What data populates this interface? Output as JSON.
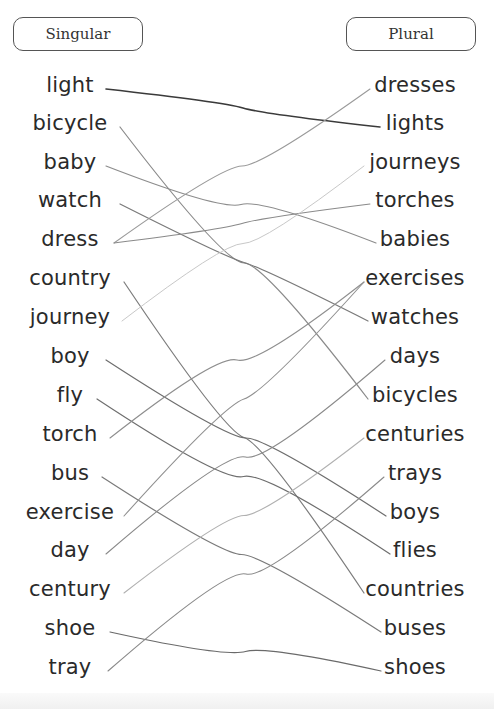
{
  "headers": {
    "singular": "Singular",
    "plural": "Plural"
  },
  "singular_words": [
    {
      "word": "light",
      "y": 87,
      "x_end": 104
    },
    {
      "word": "bicycle",
      "y": 125,
      "x_end": 118
    },
    {
      "word": "baby",
      "y": 164,
      "x_end": 104
    },
    {
      "word": "watch",
      "y": 202,
      "x_end": 118
    },
    {
      "word": "dress",
      "y": 241,
      "x_end": 112
    },
    {
      "word": "country",
      "y": 280,
      "x_end": 122
    },
    {
      "word": "journey",
      "y": 319,
      "x_end": 120
    },
    {
      "word": "boy",
      "y": 358,
      "x_end": 104
    },
    {
      "word": "fly",
      "y": 397,
      "x_end": 95
    },
    {
      "word": "torch",
      "y": 436,
      "x_end": 108
    },
    {
      "word": "bus",
      "y": 475,
      "x_end": 100
    },
    {
      "word": "exercise",
      "y": 514,
      "x_end": 122
    },
    {
      "word": "day",
      "y": 552,
      "x_end": 104
    },
    {
      "word": "century",
      "y": 591,
      "x_end": 122
    },
    {
      "word": "shoe",
      "y": 630,
      "x_end": 108
    },
    {
      "word": "tray",
      "y": 669,
      "x_end": 106
    }
  ],
  "plural_words": [
    {
      "word": "dresses",
      "y": 87,
      "x_start": 372
    },
    {
      "word": "lights",
      "y": 125,
      "x_start": 382
    },
    {
      "word": "journeys",
      "y": 164,
      "x_start": 366
    },
    {
      "word": "torches",
      "y": 202,
      "x_start": 372
    },
    {
      "word": "babies",
      "y": 241,
      "x_start": 378
    },
    {
      "word": "exercises",
      "y": 280,
      "x_start": 366
    },
    {
      "word": "watches",
      "y": 319,
      "x_start": 370
    },
    {
      "word": "days",
      "y": 358,
      "x_start": 387
    },
    {
      "word": "bicycles",
      "y": 397,
      "x_start": 370
    },
    {
      "word": "centuries",
      "y": 436,
      "x_start": 366
    },
    {
      "word": "trays",
      "y": 475,
      "x_start": 386
    },
    {
      "word": "boys",
      "y": 514,
      "x_start": 388
    },
    {
      "word": "flies",
      "y": 552,
      "x_start": 392
    },
    {
      "word": "countries",
      "y": 591,
      "x_start": 366
    },
    {
      "word": "buses",
      "y": 630,
      "x_start": 383
    },
    {
      "word": "shoes",
      "y": 669,
      "x_start": 383
    }
  ],
  "connections": [
    {
      "from": "light",
      "to": "lights",
      "color": "#3a3a3a",
      "width": 1.6
    },
    {
      "from": "bicycle",
      "to": "bicycles",
      "color": "#8a8a8a",
      "width": 1.2
    },
    {
      "from": "baby",
      "to": "babies",
      "color": "#8c8c8c",
      "width": 1.2
    },
    {
      "from": "watch",
      "to": "watches",
      "color": "#7a7a7a",
      "width": 1.2
    },
    {
      "from": "dress",
      "to": "dresses",
      "color": "#9a9a9a",
      "width": 1.1
    },
    {
      "from": "dress",
      "to": "torches",
      "color": "#8a8a8a",
      "width": 1.1
    },
    {
      "from": "country",
      "to": "countries",
      "color": "#7c7c7c",
      "width": 1.2
    },
    {
      "from": "boy",
      "to": "boys",
      "color": "#6e6e6e",
      "width": 1.2
    },
    {
      "from": "fly",
      "to": "flies",
      "color": "#6e6e6e",
      "width": 1.2
    },
    {
      "from": "torch",
      "to": "exercises",
      "color": "#8e8e8e",
      "width": 1.1
    },
    {
      "from": "bus",
      "to": "buses",
      "color": "#7a7a7a",
      "width": 1.2
    },
    {
      "from": "exercise",
      "to": "exercises",
      "color": "#909090",
      "width": 1.1
    },
    {
      "from": "day",
      "to": "days",
      "color": "#8a8a8a",
      "width": 1.1
    },
    {
      "from": "century",
      "to": "centuries",
      "color": "#b0b0b0",
      "width": 1.1
    },
    {
      "from": "shoe",
      "to": "shoes",
      "color": "#6a6a6a",
      "width": 1.2
    },
    {
      "from": "tray",
      "to": "trays",
      "color": "#8a8a8a",
      "width": 1.1
    },
    {
      "from": "journey",
      "to": "journeys",
      "color": "#c8c8c8",
      "width": 1.0
    }
  ]
}
